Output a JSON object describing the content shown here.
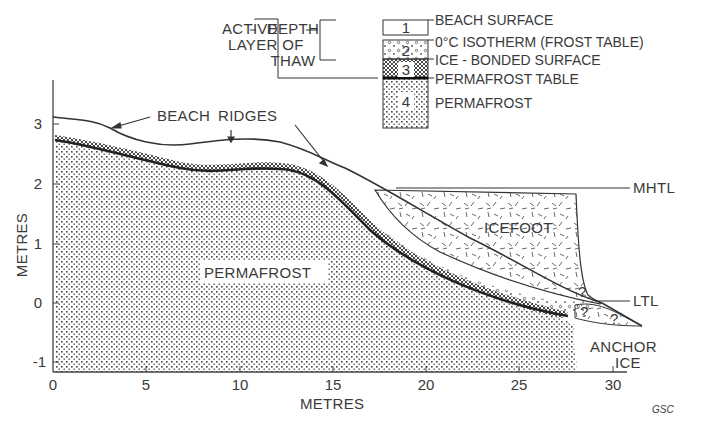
{
  "figure": {
    "credit": "GSC",
    "x_axis": {
      "label": "METRES",
      "ticks": [
        "0",
        "5",
        "10",
        "15",
        "20",
        "25",
        "30"
      ]
    },
    "y_axis": {
      "label": "METRES",
      "ticks": [
        "3",
        "2",
        "1",
        "0",
        "-1"
      ]
    }
  },
  "legend": {
    "active_layer": "ACTIVE LAYER",
    "active_layer_line1": "ACTIVE",
    "active_layer_line2": "LAYER",
    "depth_of_thaw_line1": "DEPTH",
    "depth_of_thaw_line2": "OF",
    "depth_of_thaw_line3": "THAW",
    "units": [
      {
        "number": "1",
        "label": "BEACH SURFACE"
      },
      {
        "number": "2",
        "label": "0°C ISOTHERM (FROST TABLE)"
      },
      {
        "number": "3",
        "label": "ICE - BONDED SURFACE"
      },
      {
        "number": "",
        "label": "PERMAFROST TABLE"
      },
      {
        "number": "4",
        "label": "PERMAFROST"
      }
    ]
  },
  "annotations": {
    "beach": "BEACH",
    "ridges": "RIDGES",
    "permafrost": "PERMAFROST",
    "icefoot": "ICEFOOT",
    "mhtl": "MHTL",
    "ltl": "LTL",
    "anchor": "ANCHOR",
    "ice": "ICE",
    "unknown": "?"
  },
  "colors": {
    "ink": "#333333",
    "background": "#ffffff"
  }
}
